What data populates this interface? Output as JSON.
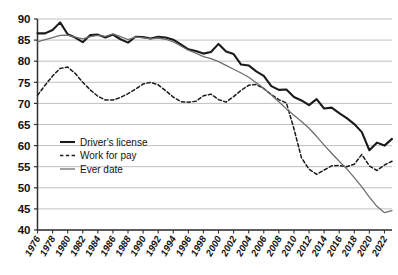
{
  "chart_data": {
    "type": "line",
    "title": "",
    "subtitle": "",
    "xlabel": "",
    "ylabel": "",
    "xlim": [
      1976,
      2023
    ],
    "ylim": [
      40,
      90
    ],
    "ytick_step": 5,
    "xtick_step": 2,
    "grid": true,
    "legend_position": "inside-center-left",
    "yticks": [
      90,
      85,
      80,
      75,
      70,
      65,
      60,
      55,
      50,
      45,
      40
    ],
    "xticks": [
      1976,
      1978,
      1980,
      1982,
      1984,
      1986,
      1988,
      1990,
      1992,
      1994,
      1996,
      1998,
      2000,
      2002,
      2004,
      2006,
      2008,
      2010,
      2012,
      2014,
      2016,
      2018,
      2020,
      2022
    ],
    "x": [
      1976,
      1977,
      1978,
      1979,
      1980,
      1981,
      1982,
      1983,
      1984,
      1985,
      1986,
      1987,
      1988,
      1989,
      1990,
      1991,
      1992,
      1993,
      1994,
      1995,
      1996,
      1997,
      1998,
      1999,
      2000,
      2001,
      2002,
      2003,
      2004,
      2005,
      2006,
      2007,
      2008,
      2009,
      2010,
      2011,
      2012,
      2013,
      2014,
      2015,
      2016,
      2017,
      2018,
      2019,
      2020,
      2021,
      2022,
      2023
    ],
    "series": [
      {
        "name": "Driver's license",
        "style": "solid",
        "width": 2.1,
        "color": "#1a1a1a",
        "values": [
          86.6,
          86.6,
          87.4,
          89.2,
          86.4,
          85.6,
          84.5,
          86.2,
          86.3,
          85.6,
          86.3,
          85.2,
          84.4,
          85.8,
          85.7,
          85.4,
          85.8,
          85.6,
          85.1,
          84.0,
          82.8,
          82.4,
          81.8,
          82.2,
          84.1,
          82.3,
          81.7,
          79.2,
          79.0,
          77.6,
          76.5,
          74.1,
          73.2,
          73.3,
          71.5,
          70.7,
          69.6,
          71.0,
          68.8,
          69.0,
          67.7,
          66.5,
          65.1,
          63.2,
          58.9,
          60.7,
          60.0,
          61.6
        ]
      },
      {
        "name": "Work for pay",
        "style": "dashed",
        "width": 1.5,
        "color": "#1a1a1a",
        "values": [
          71.9,
          74.3,
          76.5,
          78.3,
          78.6,
          77.1,
          75.0,
          73.2,
          71.7,
          70.8,
          70.8,
          71.4,
          72.3,
          73.4,
          74.6,
          75.0,
          74.4,
          73.0,
          71.5,
          70.4,
          70.3,
          70.5,
          71.8,
          72.2,
          70.9,
          70.3,
          71.6,
          73.1,
          74.3,
          74.5,
          73.5,
          72.1,
          70.9,
          70.1,
          64.0,
          57.1,
          54.4,
          53.2,
          54.2,
          55.2,
          55.3,
          55.0,
          55.6,
          57.9,
          55.2,
          54.1,
          55.4,
          56.3
        ]
      },
      {
        "name": "Ever date",
        "style": "solid",
        "width": 1.3,
        "color": "#6e6e6e",
        "values": [
          84.6,
          85.1,
          85.6,
          86.1,
          86.2,
          85.7,
          85.3,
          85.8,
          86.1,
          85.9,
          86.5,
          85.8,
          85.1,
          85.7,
          85.6,
          85.3,
          85.5,
          85.2,
          84.6,
          83.6,
          82.6,
          81.9,
          81.1,
          80.6,
          79.9,
          79.0,
          78.1,
          77.2,
          76.2,
          74.9,
          73.6,
          72.0,
          70.4,
          68.7,
          67.2,
          65.7,
          64.1,
          62.2,
          60.1,
          58.2,
          56.3,
          54.5,
          52.4,
          50.2,
          47.8,
          45.6,
          44.1,
          44.6
        ]
      }
    ],
    "legend": [
      {
        "label": "Driver's license",
        "style": "solid",
        "width": 2.1,
        "color": "#1a1a1a"
      },
      {
        "label": "Work for pay",
        "style": "dashed",
        "width": 1.5,
        "color": "#1a1a1a"
      },
      {
        "label": "Ever date",
        "style": "solid",
        "width": 1.3,
        "color": "#6e6e6e"
      }
    ]
  },
  "colors": {
    "background": "#ffffff",
    "grid": "#b9b9b9",
    "axis": "#333030",
    "text": "#15120f",
    "series_primary": "#1a1a1a",
    "series_secondary": "#6e6e6e"
  }
}
